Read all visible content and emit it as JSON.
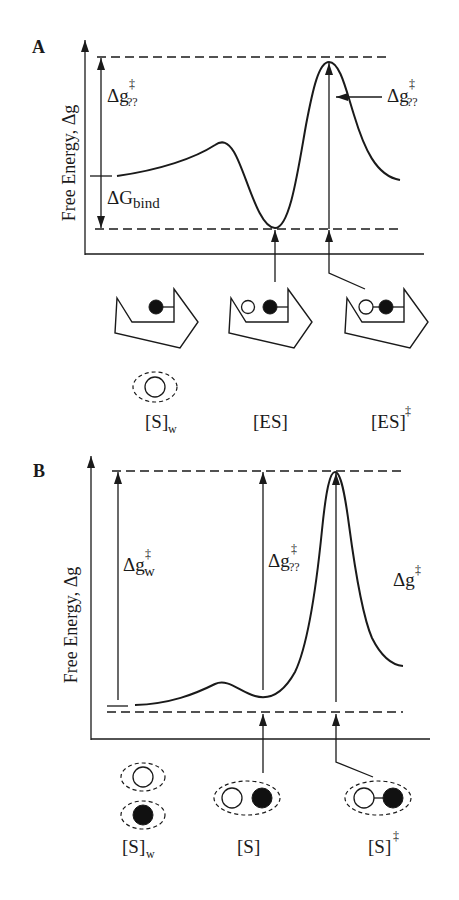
{
  "colors": {
    "ink": "#1a1a1a",
    "background": "#ffffff"
  },
  "panel_a": {
    "label": "A",
    "y_axis_label": "Free Energy, Δg",
    "barrier_left": {
      "main": "Δg",
      "sup": "‡",
      "sub": "??"
    },
    "binding": {
      "main": "ΔG",
      "sub": "bind"
    },
    "barrier_right": {
      "main": "Δg",
      "sup": "‡",
      "sub": "??"
    },
    "curve_path": "M117,176 C160,170 195,158 215,145 C222,140 228,142 234,152 C246,172 258,228 275,228 C290,228 298,170 306,125 C313,88 319,62 329,62 C340,62 346,90 354,115 C364,148 376,176 400,180",
    "states": [
      {
        "label": "[S]",
        "sub": "w"
      },
      {
        "label": "[ES]"
      },
      {
        "label": "[ES]",
        "sup": "‡"
      }
    ]
  },
  "panel_b": {
    "label": "B",
    "y_axis_label": "Free Energy, Δg",
    "barrier_water": {
      "main": "Δg",
      "sup": "‡",
      "sub": "w"
    },
    "barrier_mid": {
      "main": "Δg",
      "sup": "‡",
      "sub": "??"
    },
    "barrier_right": {
      "main": "Δg",
      "sup": "‡"
    },
    "curve_path": "M135,705 C170,704 195,694 215,684 C228,678 240,692 255,696 C272,701 285,690 295,672 C308,645 316,590 322,530 C326,490 330,472 335,472 C341,472 345,495 349,525 C355,570 362,615 372,638 C382,658 392,665 403,666",
    "states": [
      {
        "label": "[S]",
        "sub": "w"
      },
      {
        "label": "[S]"
      },
      {
        "label": "[S]",
        "sup": "‡"
      }
    ]
  }
}
